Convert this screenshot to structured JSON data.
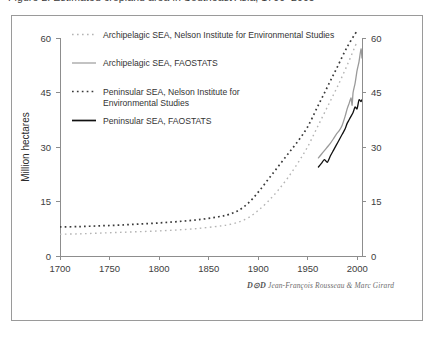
{
  "figure": {
    "clipped_caption_top": "Figure 2. Estimated cropland area in Southeast Asia, 1700–2005",
    "credit_logo": "D⊙D",
    "credit_text": "Jean-François Rousseau & Marc Girard"
  },
  "chart_data": {
    "type": "line",
    "title": "",
    "xlabel": "",
    "ylabel": "Million hectares",
    "xlim": [
      1700,
      2005
    ],
    "ylim": [
      0,
      60
    ],
    "xticks": [
      1700,
      1750,
      1800,
      1850,
      1900,
      1950,
      2000
    ],
    "xtick_labels": [
      "1700",
      "1750",
      "1800",
      "1850",
      "1900",
      "1950",
      "2000"
    ],
    "yticks": [
      0,
      15,
      30,
      45,
      60
    ],
    "ytick_labels": [
      "0",
      "15",
      "30",
      "45",
      "60"
    ],
    "right_axis": true,
    "right_ytick_labels": [
      "0",
      "15",
      "30",
      "45",
      "60"
    ],
    "grid": false,
    "legend_position": "top-left-inside",
    "series": [
      {
        "name": "Archipelagic SEA, Nelson Institute for Environmental Studies",
        "style": "dotted",
        "color": "#b4b4b4",
        "x": [
          1700,
          1720,
          1740,
          1760,
          1780,
          1800,
          1820,
          1840,
          1860,
          1870,
          1880,
          1890,
          1900,
          1910,
          1920,
          1930,
          1940,
          1950,
          1960,
          1970,
          1980,
          1990,
          2000
        ],
        "y": [
          6.0,
          6.1,
          6.3,
          6.5,
          6.7,
          6.9,
          7.2,
          7.6,
          8.2,
          8.6,
          9.3,
          10.5,
          12.5,
          15.0,
          18.0,
          21.5,
          25.5,
          30.0,
          35.5,
          41.0,
          46.5,
          52.5,
          59.0
        ]
      },
      {
        "name": "Archipelagic SEA, FAOSTATS",
        "style": "solid",
        "color": "#9a9a9a",
        "x": [
          1961,
          1964,
          1967,
          1970,
          1973,
          1976,
          1979,
          1982,
          1985,
          1988,
          1990,
          1992,
          1994,
          1995,
          1996,
          1998,
          2000,
          2002,
          2004,
          2005
        ],
        "y": [
          27.0,
          28.0,
          29.0,
          30.0,
          31.0,
          32.2,
          33.5,
          34.5,
          36.0,
          38.5,
          40.5,
          42.0,
          43.5,
          41.5,
          45.0,
          47.5,
          51.0,
          53.5,
          57.0,
          54.5
        ]
      },
      {
        "name": "Peninsular SEA, Nelson Institute for Environmental Studies",
        "style": "dashed-dotted",
        "color": "#3a3a3a",
        "x": [
          1700,
          1720,
          1740,
          1760,
          1780,
          1800,
          1820,
          1840,
          1860,
          1870,
          1880,
          1890,
          1900,
          1910,
          1920,
          1930,
          1940,
          1950,
          1960,
          1970,
          1980,
          1990,
          2000
        ],
        "y": [
          8.0,
          8.1,
          8.3,
          8.5,
          8.8,
          9.1,
          9.5,
          10.0,
          10.8,
          11.4,
          12.5,
          14.5,
          17.5,
          21.0,
          24.5,
          28.0,
          31.5,
          35.5,
          41.0,
          46.5,
          52.0,
          57.5,
          62.0
        ]
      },
      {
        "name": "Peninsular SEA, FAOSTATS",
        "style": "solid",
        "color": "#111111",
        "x": [
          1961,
          1964,
          1967,
          1970,
          1973,
          1976,
          1979,
          1982,
          1985,
          1988,
          1990,
          1992,
          1994,
          1996,
          1998,
          2000,
          2002,
          2004,
          2005
        ],
        "y": [
          24.5,
          25.5,
          26.5,
          25.8,
          27.5,
          29.0,
          30.5,
          32.0,
          33.5,
          35.0,
          36.5,
          37.5,
          38.5,
          39.5,
          41.0,
          40.5,
          43.0,
          42.5,
          43.0
        ]
      }
    ]
  },
  "legend": {
    "items": [
      {
        "label": "Archipelagic SEA, Nelson Institute for Environmental Studies",
        "swatch": "dotted-light"
      },
      {
        "label": "Archipelagic SEA, FAOSTATS",
        "swatch": "solid-grey"
      },
      {
        "label": "Peninsular SEA, Nelson Institute for",
        "label2": "Environmental Studies",
        "swatch": "dotted-dark"
      },
      {
        "label": "Peninsular SEA, FAOSTATS",
        "swatch": "solid-black"
      }
    ]
  }
}
